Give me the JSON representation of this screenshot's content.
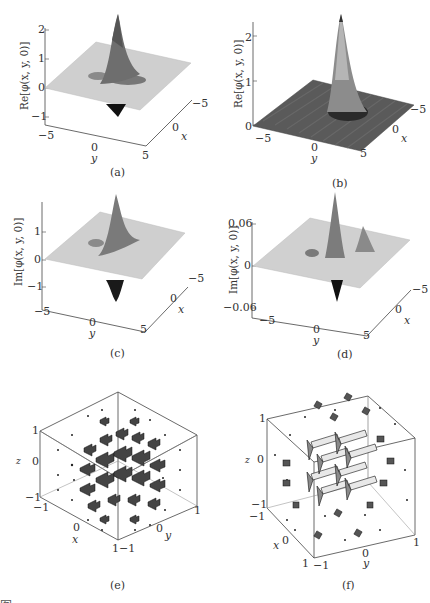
{
  "figure": {
    "panels": [
      {
        "id": "a",
        "caption": "(a)",
        "zlabel": "Re[φ(x, y, 0)]",
        "zticks": [
          "2",
          "1",
          "0",
          "−1"
        ],
        "ylabel": "y",
        "yticks": [
          "−5",
          "0",
          "5"
        ],
        "xlabel": "x",
        "xticks": [
          "−5",
          "0"
        ]
      },
      {
        "id": "b",
        "caption": "(b)",
        "zlabel": "Re[φ(x, y, 0)]",
        "zticks": [
          "2",
          "1",
          "0"
        ],
        "ylabel": "y",
        "yticks": [
          "−5",
          "0",
          "5"
        ],
        "xlabel": "x",
        "xticks": [
          "−5",
          "0"
        ]
      },
      {
        "id": "c",
        "caption": "(c)",
        "zlabel": "Im[φ(x, y, 0)]",
        "zticks": [
          "1",
          "0",
          "−1"
        ],
        "ylabel": "y",
        "yticks": [
          "−5",
          "0",
          "5"
        ],
        "xlabel": "x",
        "xticks": [
          "−5",
          "0"
        ]
      },
      {
        "id": "d",
        "caption": "(d)",
        "zlabel": "Im[φ(x, y, 0)]",
        "zticks": [
          "0.06",
          "0",
          "−0.06"
        ],
        "ylabel": "y",
        "yticks": [
          "−5",
          "0",
          "5"
        ],
        "xlabel": "x",
        "xticks": [
          "−5",
          "0"
        ]
      },
      {
        "id": "e",
        "caption": "(e)",
        "zlabel": "z",
        "zticks": [
          "1",
          "0",
          "−1"
        ],
        "xlabel": "x",
        "xticks": [
          "−1",
          "0",
          "1"
        ],
        "ylabel": "y",
        "yticks": [
          "−1",
          "0",
          "1"
        ]
      },
      {
        "id": "f",
        "caption": "(f)",
        "zlabel": "z",
        "zticks": [
          "1",
          "0",
          "−1"
        ],
        "xlabel": "x",
        "xticks": [
          "−1",
          "0",
          "1"
        ],
        "ylabel": "y",
        "yticks": [
          "−1",
          "0",
          "1"
        ]
      }
    ],
    "bottom_caption_partial": "图…"
  }
}
